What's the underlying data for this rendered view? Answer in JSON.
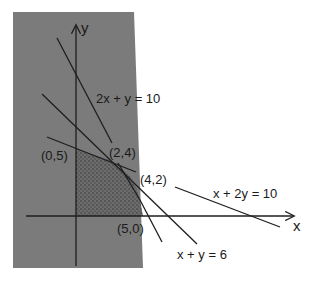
{
  "figure": {
    "colors": {
      "background": "#ffffff",
      "unfeasible_shade": "#7b7b7b",
      "feasible_base": "#6c6c6c",
      "feasible_dot": "#3a3a3a",
      "line": "#1e1e1e",
      "text": "#1a1a1a"
    },
    "axes": {
      "x_label": "x",
      "y_label": "y"
    },
    "constraints": [
      {
        "id": "c1",
        "label": "2x + y = 10"
      },
      {
        "id": "c2",
        "label": "x + y = 6"
      },
      {
        "id": "c3",
        "label": "x + 2y = 10"
      }
    ],
    "vertices": [
      {
        "label": "(0,5)"
      },
      {
        "label": "(2,4)"
      },
      {
        "label": "(4,2)"
      },
      {
        "label": "(5,0)"
      }
    ],
    "feasible_region": "shaded region bounded by axes and the three constraint lines"
  }
}
